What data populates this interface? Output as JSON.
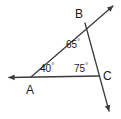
{
  "figure": {
    "kind": "geometry-diagram",
    "background_color": "#ffffff",
    "stroke_color": "#3b3b3b",
    "text_color": "#1a1a1a",
    "width": 121,
    "height": 119,
    "vertices": [
      {
        "name": "A",
        "label": "A",
        "x": 31,
        "y": 77
      },
      {
        "name": "B",
        "label": "B",
        "x": 85,
        "y": 23
      },
      {
        "name": "C",
        "label": "C",
        "x": 99,
        "y": 76
      }
    ],
    "angles": [
      {
        "at": "A",
        "value": 40,
        "label": "40",
        "degree_symbol": "°"
      },
      {
        "at": "B",
        "value": 65,
        "label": "65",
        "degree_symbol": "°"
      },
      {
        "at": "C",
        "value": 75,
        "label": "75",
        "degree_symbol": "°"
      }
    ],
    "rays": [
      {
        "name": "horizontal-ray-left",
        "from": "A",
        "arrow_at": "left-end"
      },
      {
        "name": "ray-A-through-B",
        "from": "A",
        "arrow_at": "upper-right-end"
      },
      {
        "name": "ray-B-through-C",
        "from": "B",
        "arrow_at": "lower-right-end"
      }
    ],
    "segments": [
      {
        "name": "segment-A-B",
        "from": "A",
        "to": "B"
      },
      {
        "name": "segment-A-C",
        "from": "A",
        "to": "C"
      },
      {
        "name": "segment-B-C",
        "from": "B",
        "to": "C"
      }
    ]
  }
}
